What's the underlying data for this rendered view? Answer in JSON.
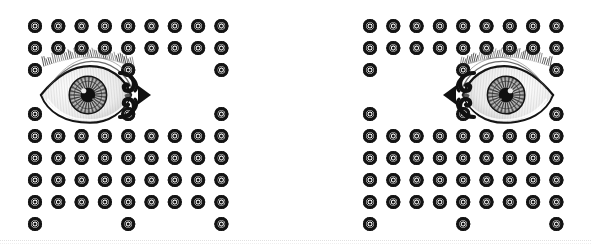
{
  "document": {
    "title": "Hypnosis Eye Spiral Graphic",
    "width": 592,
    "height": 252,
    "background_color": "#ffffff",
    "ink_color": "#111111",
    "rule_color": "#c9c9c9",
    "description": "Symmetric black-and-white vintage-engraving style illustration: two mirrored human eyes, decorative scroll arrows, two small hypnotic spirals and one large central hypnotic spiral, all set on a field of small sunburst rosette motifs."
  },
  "rules": [
    {
      "name": "top-dotted-rule",
      "y": 6
    },
    {
      "name": "top-dotted-rule-secondary",
      "y": 9
    },
    {
      "name": "bottom-dotted-rule",
      "y": 240
    },
    {
      "name": "bottom-dotted-rule-secondary",
      "y": 243
    }
  ],
  "motif": {
    "name": "sunburst-rosette",
    "diameter": 14,
    "spokes": 16,
    "rings": 3,
    "color": "#141414"
  },
  "grid": {
    "name": "rosette-field",
    "column_pitch": 23.3,
    "row_pitch": 22,
    "left_block": {
      "first_column_x": 35,
      "columns": 9,
      "rows_y": [
        26,
        48,
        70,
        92,
        114,
        136,
        158,
        180,
        202,
        224
      ]
    },
    "right_block": {
      "first_column_x": 370,
      "columns": 9,
      "rows_y": [
        26,
        48,
        70,
        92,
        114,
        136,
        158,
        180,
        202,
        224
      ]
    },
    "full_rows": [
      26,
      48,
      158,
      180,
      202
    ],
    "sparse_rows": [
      70,
      114,
      224
    ]
  },
  "spirals": [
    {
      "name": "spiral-left-small",
      "center_x": 188,
      "center_y": 95,
      "radius": 31,
      "turns": 9,
      "direction": "clockwise"
    },
    {
      "name": "spiral-center-large",
      "center_x": 297,
      "center_y": 95,
      "radius": 66,
      "turns": 12,
      "direction": "clockwise"
    },
    {
      "name": "spiral-right-small",
      "center_x": 406,
      "center_y": 95,
      "radius": 31,
      "turns": 9,
      "direction": "counter-clockwise"
    }
  ],
  "eyes": [
    {
      "name": "eye-left",
      "center_x": 86,
      "center_y": 95,
      "width": 96,
      "height": 62,
      "gaze": "right",
      "style": "engraving"
    },
    {
      "name": "eye-right",
      "center_x": 508,
      "center_y": 95,
      "width": 96,
      "height": 62,
      "gaze": "left",
      "style": "engraving"
    }
  ],
  "arrows": [
    {
      "name": "scroll-arrow-left",
      "center_x": 135,
      "center_y": 95,
      "points": "right"
    },
    {
      "name": "scroll-arrow-right",
      "center_x": 459,
      "center_y": 95,
      "points": "left"
    }
  ]
}
